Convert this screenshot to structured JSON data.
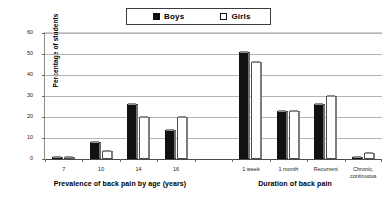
{
  "legend": {
    "entries": [
      {
        "label": "Boys",
        "swatch": "filled-black-square",
        "color": "#111111"
      },
      {
        "label": "Girls",
        "swatch": "open-white-square",
        "color": "#ffffff"
      }
    ]
  },
  "axes": {
    "y_title": "Percentage of students",
    "y_ticks": [
      "60",
      "50",
      "40",
      "30",
      "20",
      "10",
      "0"
    ]
  },
  "sections": [
    {
      "title": "Prevalence of back pain by age (years)"
    },
    {
      "title": "Duration of back pain"
    }
  ],
  "chart_data": {
    "type": "bar",
    "title": "",
    "xlabel": "",
    "ylabel": "Percentage of students",
    "ylim": [
      0,
      60
    ],
    "ytick_step": 10,
    "grid": true,
    "legend_position": "top-center",
    "categories": [
      "7",
      "10",
      "14",
      "16",
      "1 week",
      "1 month",
      "Recurrent",
      "Chronic,\ncontinuous"
    ],
    "category_sections": [
      {
        "label": "Prevalence of back pain by age (years)",
        "categories": [
          "7",
          "10",
          "14",
          "16"
        ]
      },
      {
        "label": "Duration of back pain",
        "categories": [
          "1 week",
          "1 month",
          "Recurrent",
          "Chronic,\ncontinuous"
        ]
      }
    ],
    "series": [
      {
        "name": "Boys",
        "values": [
          1,
          8,
          26,
          14,
          51,
          23,
          26,
          0.5
        ]
      },
      {
        "name": "Girls",
        "values": [
          1,
          4,
          20,
          20,
          46,
          23,
          30,
          3
        ]
      }
    ]
  }
}
